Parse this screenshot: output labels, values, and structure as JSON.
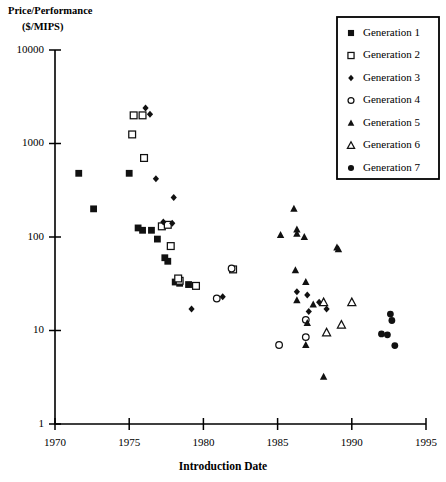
{
  "chart_data": {
    "type": "scatter",
    "title": "",
    "xlabel": "Introduction Date",
    "ylabel_line1": "Price/Performance",
    "ylabel_line2": "($/MIPS)",
    "xlim": [
      1970,
      1995
    ],
    "ylim": [
      1,
      10000
    ],
    "yscale": "log",
    "xticks": [
      1970,
      1975,
      1980,
      1985,
      1990,
      1995
    ],
    "yticks": [
      1,
      10,
      100,
      1000,
      10000
    ],
    "ytick_labels": [
      "1",
      "10",
      "100",
      "1000",
      "10000"
    ],
    "grid": false,
    "legend_position": "top-right",
    "series": [
      {
        "name": "Generation 1",
        "marker": "filled-square",
        "points": [
          [
            1971.6,
            480
          ],
          [
            1972.6,
            200
          ],
          [
            1975.0,
            480
          ],
          [
            1975.6,
            125
          ],
          [
            1975.9,
            118
          ],
          [
            1976.5,
            118
          ],
          [
            1976.9,
            95
          ],
          [
            1977.4,
            60
          ],
          [
            1977.6,
            55
          ],
          [
            1978.1,
            33
          ],
          [
            1978.4,
            32
          ],
          [
            1979.0,
            31
          ]
        ]
      },
      {
        "name": "Generation 2",
        "marker": "open-square",
        "points": [
          [
            1975.3,
            2000
          ],
          [
            1975.2,
            1250
          ],
          [
            1975.9,
            2000
          ],
          [
            1976.0,
            700
          ],
          [
            1977.2,
            130
          ],
          [
            1977.6,
            135
          ],
          [
            1977.8,
            80
          ],
          [
            1978.4,
            34
          ],
          [
            1978.3,
            36
          ],
          [
            1979.5,
            30
          ],
          [
            1982.0,
            45
          ]
        ]
      },
      {
        "name": "Generation 3",
        "marker": "small-diamond",
        "points": [
          [
            1976.1,
            2400
          ],
          [
            1976.4,
            2050
          ],
          [
            1976.8,
            420
          ],
          [
            1978.0,
            265
          ],
          [
            1977.3,
            145
          ],
          [
            1977.9,
            140
          ],
          [
            1979.2,
            17
          ],
          [
            1981.3,
            23
          ],
          [
            1986.3,
            26
          ],
          [
            1987.0,
            24
          ],
          [
            1987.1,
            16
          ],
          [
            1987.8,
            20
          ],
          [
            1988.3,
            17
          ]
        ]
      },
      {
        "name": "Generation 4",
        "marker": "open-circle",
        "points": [
          [
            1981.9,
            46
          ],
          [
            1980.9,
            22
          ],
          [
            1985.1,
            7
          ],
          [
            1986.9,
            13
          ],
          [
            1986.9,
            8.5
          ]
        ]
      },
      {
        "name": "Generation 5",
        "marker": "filled-triangle",
        "points": [
          [
            1985.2,
            105
          ],
          [
            1986.1,
            200
          ],
          [
            1986.3,
            120
          ],
          [
            1986.3,
            108
          ],
          [
            1986.8,
            100
          ],
          [
            1986.2,
            44
          ],
          [
            1986.9,
            33
          ],
          [
            1986.3,
            21
          ],
          [
            1987.4,
            19
          ],
          [
            1987.0,
            12
          ],
          [
            1986.9,
            7.0
          ],
          [
            1988.1,
            3.2
          ],
          [
            1989.0,
            77
          ],
          [
            1989.1,
            74
          ]
        ]
      },
      {
        "name": "Generation 6",
        "marker": "open-triangle",
        "points": [
          [
            1988.1,
            20
          ],
          [
            1988.3,
            9.5
          ],
          [
            1990.0,
            20
          ],
          [
            1989.3,
            11.5
          ]
        ]
      },
      {
        "name": "Generation 7",
        "marker": "filled-circle",
        "points": [
          [
            1992.6,
            15
          ],
          [
            1992.7,
            12.8
          ],
          [
            1992.0,
            9.2
          ],
          [
            1992.4,
            9.0
          ],
          [
            1992.9,
            6.9
          ]
        ]
      }
    ]
  },
  "legend": {
    "entries": [
      {
        "label": "Generation 1",
        "marker": "filled-square"
      },
      {
        "label": "Generation 2",
        "marker": "open-square"
      },
      {
        "label": "Generation 3",
        "marker": "small-diamond"
      },
      {
        "label": "Generation 4",
        "marker": "open-circle"
      },
      {
        "label": "Generation 5",
        "marker": "filled-triangle"
      },
      {
        "label": "Generation 6",
        "marker": "open-triangle"
      },
      {
        "label": "Generation 7",
        "marker": "filled-circle"
      }
    ]
  },
  "colors": {
    "axis": "#000000",
    "marker": "#111111",
    "background": "#ffffff"
  }
}
